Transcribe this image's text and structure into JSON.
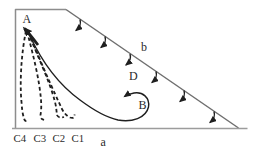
{
  "diagram": {
    "labels": {
      "A": "A",
      "b": "b",
      "D": "D",
      "B": "B",
      "a": "a"
    },
    "c_labels": [
      "C4",
      "C3",
      "C2",
      "C1"
    ],
    "colors": {
      "border": "#8d8d8d",
      "slope_edge": "#6f6f6f",
      "base_edge": "#9c9c9c",
      "ink": "#1f1f1f",
      "text": "#2b2b2b",
      "background": "#ffffff"
    }
  }
}
